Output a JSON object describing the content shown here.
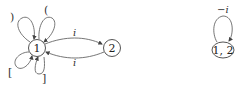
{
  "diagram": {
    "left_graph": {
      "nodes": [
        {
          "id": "1",
          "label": "1"
        },
        {
          "id": "2",
          "label": "2"
        }
      ],
      "self_loops_node1": [
        {
          "position": "top-left",
          "label": ")"
        },
        {
          "position": "top-right",
          "label": "("
        },
        {
          "position": "bottom-left",
          "label": "["
        },
        {
          "position": "bottom-right",
          "label": "]"
        }
      ],
      "edges": [
        {
          "from": "1",
          "to": "2",
          "label": "i"
        },
        {
          "from": "2",
          "to": "1",
          "label": "i"
        }
      ]
    },
    "right_graph": {
      "node": {
        "id": "12",
        "label": "1, 2"
      },
      "self_loop": {
        "label": "−i"
      }
    },
    "colors": {
      "stroke": "#555555",
      "text": "#333333"
    }
  }
}
